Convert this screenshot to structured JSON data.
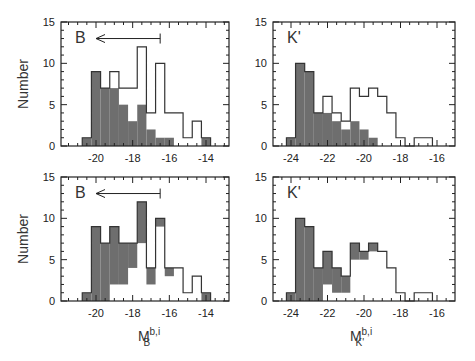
{
  "figure": {
    "ylabel": "Number",
    "xlabel_left": {
      "base": "M",
      "sup": "b,i",
      "sub": "B"
    },
    "xlabel_right": {
      "base": "M",
      "sup": "b,i",
      "sub": "K'"
    },
    "colors": {
      "grey_fill": "#6e6e6e",
      "outline": "#333333",
      "frame": "#222222"
    }
  },
  "chart_data": [
    {
      "type": "bar",
      "panel": "top-left",
      "band_label": "B",
      "annotation": "left-pointing arrow from -16.5 to about -20",
      "arrow": {
        "x_from": -16.5,
        "x_to": -20.0,
        "y": 13
      },
      "xlabel": "",
      "ylabel": "Number",
      "xlim": [
        -21.8,
        -12.7
      ],
      "ylim": [
        0,
        15
      ],
      "xticks": [
        -20,
        -18,
        -16,
        -14
      ],
      "yticks": [
        0,
        5,
        10,
        15
      ],
      "bin_width": 0.5,
      "bin_start": -20.75,
      "series": [
        {
          "name": "total (open)",
          "values": [
            1,
            9,
            7,
            9,
            7,
            7,
            12,
            4,
            10,
            4,
            4,
            1,
            3,
            1
          ]
        },
        {
          "name": "shaded subset",
          "values": [
            1,
            9,
            7,
            7,
            5,
            3,
            5,
            2,
            1,
            1,
            0,
            0,
            0,
            1
          ]
        }
      ]
    },
    {
      "type": "bar",
      "panel": "top-right",
      "band_label": "K'",
      "xlabel": "",
      "ylabel": "",
      "xlim": [
        -25.0,
        -15.0
      ],
      "ylim": [
        0,
        15
      ],
      "xticks": [
        -24,
        -22,
        -20,
        -18,
        -16
      ],
      "yticks": [
        0,
        5,
        10,
        15
      ],
      "bin_width": 0.5,
      "bin_start": -24.25,
      "series": [
        {
          "name": "total (open)",
          "values": [
            1,
            10,
            9,
            4,
            6,
            4,
            3,
            7,
            6,
            7,
            6,
            4,
            1,
            0,
            1,
            1
          ]
        },
        {
          "name": "shaded subset",
          "values": [
            1,
            10,
            9,
            4,
            4,
            3,
            2,
            3,
            2,
            1,
            0,
            0,
            0,
            0,
            0,
            0
          ]
        }
      ]
    },
    {
      "type": "bar",
      "panel": "bottom-left",
      "band_label": "B",
      "annotation": "left-pointing arrow from -16.5 to about -20",
      "arrow": {
        "x_from": -16.5,
        "x_to": -20.0,
        "y": 13
      },
      "xlabel": "M_B^{b,i}",
      "ylabel": "Number",
      "xlim": [
        -21.8,
        -12.7
      ],
      "ylim": [
        0,
        15
      ],
      "xticks": [
        -20,
        -18,
        -16,
        -14
      ],
      "yticks": [
        0,
        5,
        10,
        15
      ],
      "bin_width": 0.5,
      "bin_start": -20.75,
      "series": [
        {
          "name": "total (open)",
          "values": [
            1,
            9,
            7,
            9,
            7,
            7,
            12,
            4,
            10,
            4,
            4,
            1,
            3,
            1
          ]
        },
        {
          "name": "shaded range low",
          "values": [
            0,
            0,
            0,
            2,
            2,
            4,
            7,
            2,
            9,
            3,
            0,
            0,
            0,
            0
          ]
        },
        {
          "name": "shaded range high",
          "values": [
            1,
            9,
            7,
            9,
            7,
            7,
            12,
            4,
            10,
            4,
            0,
            0,
            0,
            1
          ]
        }
      ]
    },
    {
      "type": "bar",
      "panel": "bottom-right",
      "band_label": "K'",
      "xlabel": "M_K'^{b,i}",
      "ylabel": "",
      "xlim": [
        -25.0,
        -15.0
      ],
      "ylim": [
        0,
        15
      ],
      "xticks": [
        -24,
        -22,
        -20,
        -18,
        -16
      ],
      "yticks": [
        0,
        5,
        10,
        15
      ],
      "bin_width": 0.5,
      "bin_start": -24.25,
      "series": [
        {
          "name": "total (open)",
          "values": [
            1,
            10,
            9,
            4,
            6,
            4,
            3,
            7,
            6,
            7,
            6,
            4,
            1,
            0,
            1,
            1
          ]
        },
        {
          "name": "shaded range low",
          "values": [
            0,
            0,
            0,
            0,
            2,
            1,
            1,
            5,
            5,
            6,
            0,
            0,
            0,
            0,
            0,
            0
          ]
        },
        {
          "name": "shaded range high",
          "values": [
            1,
            10,
            9,
            4,
            6,
            4,
            3,
            7,
            6,
            7,
            0,
            0,
            0,
            0,
            0,
            0
          ]
        }
      ]
    }
  ],
  "panels": {
    "tl": {
      "band": "B"
    },
    "tr": {
      "band": "K'"
    },
    "bl": {
      "band": "B"
    },
    "br": {
      "band": "K'"
    }
  }
}
